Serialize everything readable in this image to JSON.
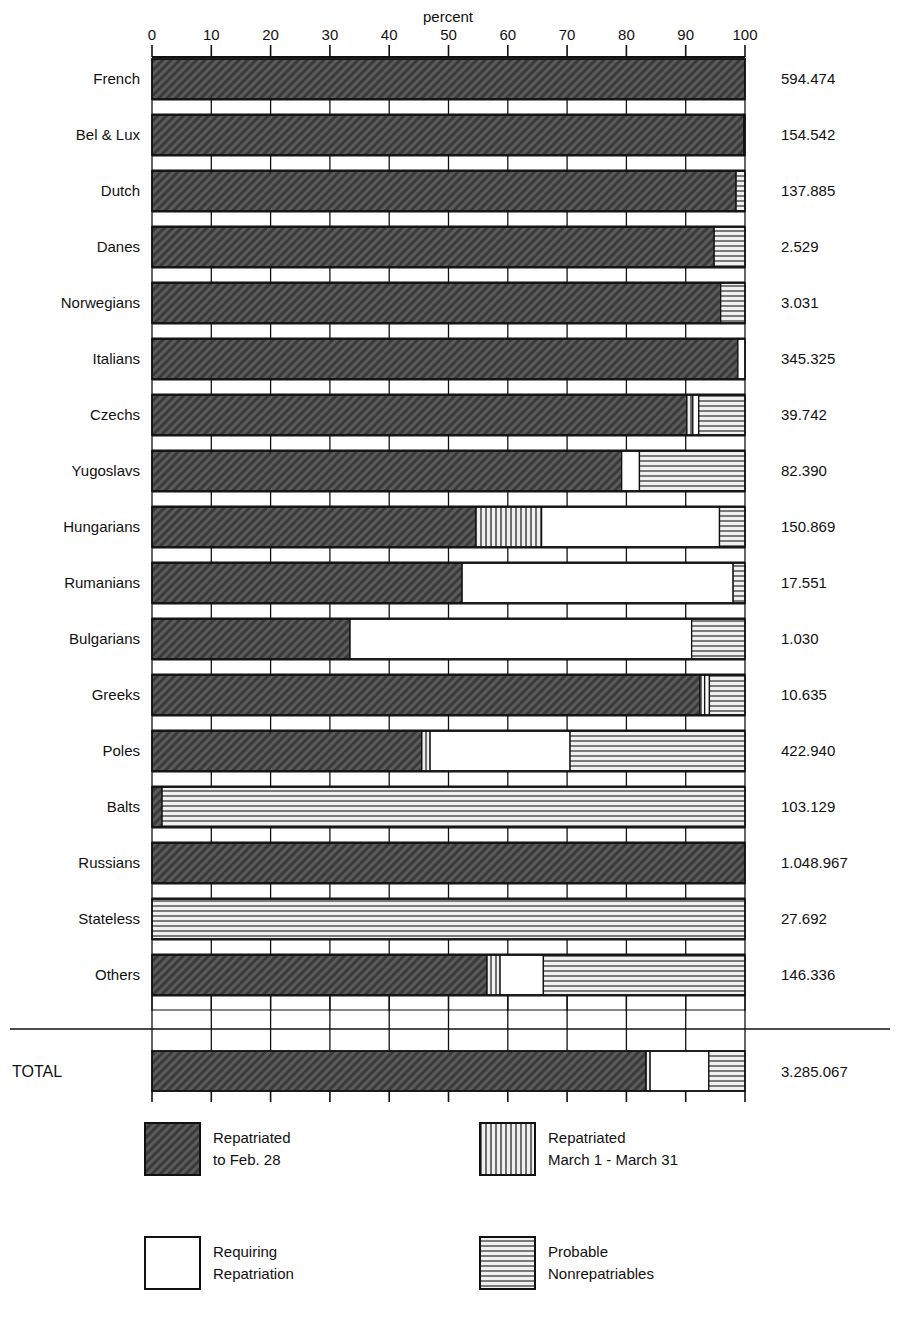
{
  "chart_data": {
    "type": "bar",
    "orientation": "horizontal",
    "stacked": true,
    "title": "",
    "xlabel": "percent",
    "ylabel": "",
    "xlim": [
      0,
      100
    ],
    "xticks": [
      0,
      10,
      20,
      30,
      40,
      50,
      60,
      70,
      80,
      90,
      100
    ],
    "xtick_labels": [
      "0",
      "10",
      "20",
      "30",
      "40",
      "50",
      "60",
      "70",
      "80",
      "90",
      "100"
    ],
    "grid": true,
    "legend_position": "bottom",
    "series": [
      {
        "name": "Repatriated to Feb. 28",
        "pattern": "diagonal-hatch-dark",
        "color": "#4a4a4a"
      },
      {
        "name": "Repatriated March 1 - March 31",
        "pattern": "vertical-stripes",
        "color": "#9a9a9a"
      },
      {
        "name": "Requiring Repatriation",
        "pattern": "solid-white",
        "color": "#ffffff"
      },
      {
        "name": "Probable Nonrepatriables",
        "pattern": "horizontal-stripes",
        "color": "#b0b0b0"
      }
    ],
    "categories": [
      "French",
      "Bel & Lux",
      "Dutch",
      "Danes",
      "Norwegians",
      "Italians",
      "Czechs",
      "Yugoslavs",
      "Hungarians",
      "Rumanians",
      "Bulgarians",
      "Greeks",
      "Poles",
      "Balts",
      "Russians",
      "Stateless",
      "Others"
    ],
    "rows": [
      {
        "label": "French",
        "value": "594.474",
        "segments": [
          100.0,
          0.0,
          0.0,
          0.0
        ]
      },
      {
        "label": "Bel & Lux",
        "value": "154.542",
        "segments": [
          99.8,
          0.0,
          0.0,
          0.2
        ]
      },
      {
        "label": "Dutch",
        "value": "137.885",
        "segments": [
          98.5,
          0.0,
          0.0,
          1.5
        ]
      },
      {
        "label": "Danes",
        "value": "2.529",
        "segments": [
          94.8,
          0.0,
          0.0,
          5.2
        ]
      },
      {
        "label": "Norwegians",
        "value": "3.031",
        "segments": [
          95.9,
          0.0,
          0.0,
          4.1
        ]
      },
      {
        "label": "Italians",
        "value": "345.325",
        "segments": [
          98.8,
          0.0,
          1.2,
          0.0
        ]
      },
      {
        "label": "Czechs",
        "value": "39.742",
        "segments": [
          90.2,
          1.0,
          1.0,
          7.8
        ]
      },
      {
        "label": "Yugoslavs",
        "value": "82.390",
        "segments": [
          79.2,
          0.0,
          3.0,
          17.8
        ]
      },
      {
        "label": "Hungarians",
        "value": "150.869",
        "segments": [
          54.6,
          11.1,
          30.0,
          4.3
        ]
      },
      {
        "label": "Rumanians",
        "value": "17.551",
        "segments": [
          52.3,
          0.0,
          45.7,
          2.0
        ]
      },
      {
        "label": "Bulgarians",
        "value": "1.030",
        "segments": [
          33.4,
          0.0,
          57.6,
          9.0
        ]
      },
      {
        "label": "Greeks",
        "value": "10.635",
        "segments": [
          92.4,
          0.8,
          0.8,
          6.0
        ]
      },
      {
        "label": "Poles",
        "value": "422.940",
        "segments": [
          45.5,
          1.4,
          23.6,
          29.5
        ]
      },
      {
        "label": "Balts",
        "value": "103.129",
        "segments": [
          1.7,
          0.0,
          0.0,
          98.3
        ]
      },
      {
        "label": "Russians",
        "value": "1.048.967",
        "segments": [
          100.0,
          0.0,
          0.0,
          0.0
        ]
      },
      {
        "label": "Stateless",
        "value": "27.692",
        "segments": [
          0.0,
          0.0,
          0.0,
          100.0
        ]
      },
      {
        "label": "Others",
        "value": "146.336",
        "segments": [
          56.5,
          2.2,
          7.3,
          34.0
        ]
      }
    ],
    "total_row": {
      "label": "TOTAL",
      "value": "3.285.067",
      "segments": [
        83.3,
        0.7,
        9.9,
        6.1
      ]
    },
    "annotations": []
  },
  "axis": {
    "title": "percent",
    "ticks": [
      "0",
      "10",
      "20",
      "30",
      "40",
      "50",
      "60",
      "70",
      "80",
      "90",
      "100"
    ]
  },
  "legend": {
    "items": [
      {
        "line1": "Repatriated",
        "line2": "to Feb. 28",
        "pattern": "diagonal-hatch-dark"
      },
      {
        "line1": "Repatriated",
        "line2": "March 1 - March 31",
        "pattern": "vertical-stripes"
      },
      {
        "line1": "Requiring",
        "line2": "Repatriation",
        "pattern": "solid-white"
      },
      {
        "line1": "Probable",
        "line2": "Nonrepatriables",
        "pattern": "horizontal-stripes"
      }
    ]
  },
  "rows_labels": [
    "French",
    "Bel & Lux",
    "Dutch",
    "Danes",
    "Norwegians",
    "Italians",
    "Czechs",
    "Yugoslavs",
    "Hungarians",
    "Rumanians",
    "Bulgarians",
    "Greeks",
    "Poles",
    "Balts",
    "Russians",
    "Stateless",
    "Others"
  ],
  "rows_values": [
    "594.474",
    "154.542",
    "137.885",
    "2.529",
    "3.031",
    "345.325",
    "39.742",
    "82.390",
    "150.869",
    "17.551",
    "1.030",
    "10.635",
    "422.940",
    "103.129",
    "1.048.967",
    "27.692",
    "146.336"
  ],
  "total": {
    "label": "TOTAL",
    "value": "3.285.067"
  }
}
